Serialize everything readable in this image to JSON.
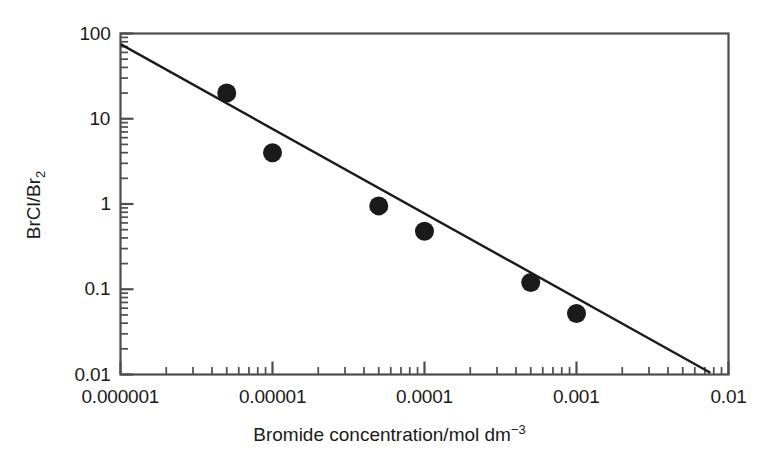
{
  "chart_data": {
    "type": "scatter",
    "title": "",
    "xlabel": "Bromide concentration/mol dm−3",
    "ylabel": "BrCl/Br2",
    "ylabel_parts": {
      "base": "BrCl/Br",
      "sub": "2"
    },
    "xlabel_parts": {
      "base": "Bromide concentration/mol dm",
      "sup": "−3"
    },
    "xscale": "log",
    "yscale": "log",
    "xlim": [
      1e-06,
      0.01
    ],
    "ylim": [
      0.01,
      100
    ],
    "grid": false,
    "legend": "none",
    "xticks": [
      1e-06,
      1e-05,
      0.0001,
      0.001,
      0.01
    ],
    "xtick_labels": [
      "0.000001",
      "0.00001",
      "0.0001",
      "0.001",
      "0.01"
    ],
    "yticks": [
      0.01,
      0.1,
      1,
      10,
      100
    ],
    "ytick_labels": [
      "0.01",
      "0.1",
      "1",
      "10",
      "100"
    ],
    "minor_ticks": true,
    "x": [
      5e-06,
      1e-05,
      5e-05,
      0.0001,
      0.0005,
      0.001
    ],
    "y": [
      20,
      4.0,
      0.95,
      0.48,
      0.12,
      0.052
    ],
    "points": [
      {
        "x": 5e-06,
        "y": 20
      },
      {
        "x": 1e-05,
        "y": 4.0
      },
      {
        "x": 5e-05,
        "y": 0.95
      },
      {
        "x": 0.0001,
        "y": 0.48
      },
      {
        "x": 0.0005,
        "y": 0.12
      },
      {
        "x": 0.001,
        "y": 0.052
      }
    ],
    "marker": {
      "shape": "circle",
      "color": "#1a1a1a",
      "size": 19
    },
    "fit_line": {
      "label": "",
      "color": "#1a1a1a",
      "width": 2.4,
      "x_start": 1e-06,
      "y_start": 75,
      "x_end": 0.0076,
      "y_end": 0.0105
    },
    "axis_color": "#4d4d4d",
    "spines": [
      "left",
      "bottom",
      "top",
      "right"
    ]
  }
}
